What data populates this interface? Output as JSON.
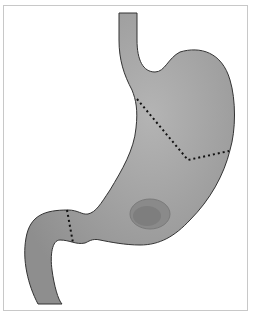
{
  "figure": {
    "colors": {
      "organ_fill": "#9a9a9a",
      "organ_highlight": "#b4b4b4",
      "outline": "#333333",
      "dashed_line": "#111111",
      "frame_border": "#c8c8c8",
      "background": "#ffffff"
    },
    "markers": [
      {
        "name": "fundus-body-boundary",
        "style": "dashed"
      },
      {
        "name": "pylorus-boundary",
        "style": "dashed"
      }
    ],
    "features": [
      "esophagus",
      "stomach-body",
      "ulcer-lesion",
      "duodenum"
    ]
  }
}
